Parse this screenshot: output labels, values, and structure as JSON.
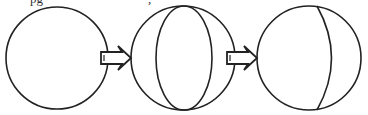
{
  "figure": {
    "top_cut_text": {
      "left_fragment": "pg",
      "middle_fragment": ","
    },
    "colors": {
      "stroke": "#222222",
      "background": "#ffffff"
    },
    "stages": [
      {
        "id": "sphere-plain",
        "description": "plain circle"
      },
      {
        "id": "sphere-full-meridian",
        "description": "circle with full inner ellipse"
      },
      {
        "id": "sphere-half-meridian",
        "description": "circle with right-side arc"
      }
    ],
    "arrows": [
      {
        "from": "sphere-plain",
        "to": "sphere-full-meridian",
        "style": "hollow-double-line"
      },
      {
        "from": "sphere-full-meridian",
        "to": "sphere-half-meridian",
        "style": "hollow-double-line"
      }
    ]
  }
}
